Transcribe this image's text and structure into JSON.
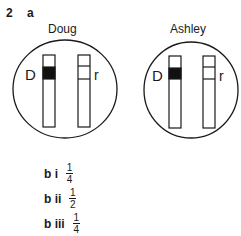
{
  "question": {
    "number": "2",
    "part": "a"
  },
  "diagram": {
    "cells": [
      {
        "name": "Doug",
        "left_label": "D",
        "right_label": "r"
      },
      {
        "name": "Ashley",
        "left_label": "D",
        "right_label": "r"
      }
    ],
    "colors": {
      "stroke": "#1a1a1a",
      "band_fill": "#111111",
      "background": "#ffffff"
    }
  },
  "answers": [
    {
      "label": "b i",
      "numerator": "1",
      "denominator": "4"
    },
    {
      "label": "b ii",
      "numerator": "1",
      "denominator": "2"
    },
    {
      "label": "b iii",
      "numerator": "1",
      "denominator": "4"
    }
  ]
}
